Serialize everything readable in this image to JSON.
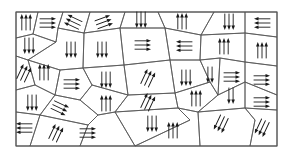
{
  "figure": {
    "width": 291,
    "height": 161,
    "frame": {
      "x": 16,
      "y": 12,
      "width": 261,
      "height": 134
    },
    "colors": {
      "border": "#555555",
      "arrow": "#1a1a1a",
      "background": "#ffffff"
    },
    "grain_boundaries": [
      [
        [
          16,
          12
        ],
        [
          38,
          12
        ],
        [
          33,
          34
        ],
        [
          16,
          38
        ]
      ],
      [
        [
          38,
          12
        ],
        [
          63,
          12
        ],
        [
          58,
          28
        ],
        [
          56,
          42
        ],
        [
          33,
          34
        ]
      ],
      [
        [
          63,
          12
        ],
        [
          90,
          12
        ],
        [
          84,
          33
        ],
        [
          58,
          28
        ]
      ],
      [
        [
          90,
          12
        ],
        [
          125,
          12
        ],
        [
          120,
          28
        ],
        [
          84,
          33
        ]
      ],
      [
        [
          125,
          12
        ],
        [
          158,
          12
        ],
        [
          165,
          28
        ],
        [
          120,
          28
        ]
      ],
      [
        [
          158,
          12
        ],
        [
          214,
          12
        ],
        [
          201,
          35
        ],
        [
          165,
          28
        ]
      ],
      [
        [
          214,
          12
        ],
        [
          245,
          12
        ],
        [
          245,
          33
        ],
        [
          201,
          35
        ]
      ],
      [
        [
          245,
          12
        ],
        [
          277,
          12
        ],
        [
          277,
          37
        ],
        [
          245,
          33
        ]
      ],
      [
        [
          16,
          38
        ],
        [
          33,
          34
        ],
        [
          56,
          42
        ],
        [
          28,
          60
        ],
        [
          16,
          56
        ]
      ],
      [
        [
          16,
          56
        ],
        [
          28,
          60
        ],
        [
          35,
          85
        ],
        [
          16,
          90
        ]
      ],
      [
        [
          56,
          42
        ],
        [
          58,
          28
        ],
        [
          84,
          33
        ],
        [
          83,
          68
        ],
        [
          60,
          70
        ],
        [
          28,
          60
        ]
      ],
      [
        [
          84,
          33
        ],
        [
          120,
          28
        ],
        [
          124,
          65
        ],
        [
          83,
          68
        ]
      ],
      [
        [
          120,
          28
        ],
        [
          165,
          28
        ],
        [
          170,
          60
        ],
        [
          124,
          65
        ]
      ],
      [
        [
          165,
          28
        ],
        [
          201,
          35
        ],
        [
          200,
          60
        ],
        [
          170,
          60
        ]
      ],
      [
        [
          201,
          35
        ],
        [
          245,
          33
        ],
        [
          245,
          62
        ],
        [
          220,
          58
        ],
        [
          200,
          60
        ]
      ],
      [
        [
          245,
          33
        ],
        [
          277,
          37
        ],
        [
          277,
          66
        ],
        [
          245,
          62
        ]
      ],
      [
        [
          28,
          60
        ],
        [
          60,
          70
        ],
        [
          55,
          95
        ],
        [
          35,
          85
        ]
      ],
      [
        [
          60,
          70
        ],
        [
          83,
          68
        ],
        [
          92,
          85
        ],
        [
          80,
          100
        ],
        [
          55,
          95
        ]
      ],
      [
        [
          83,
          68
        ],
        [
          124,
          65
        ],
        [
          128,
          95
        ],
        [
          92,
          85
        ]
      ],
      [
        [
          124,
          65
        ],
        [
          170,
          60
        ],
        [
          175,
          93
        ],
        [
          128,
          95
        ]
      ],
      [
        [
          170,
          60
        ],
        [
          200,
          60
        ],
        [
          210,
          82
        ],
        [
          175,
          93
        ]
      ],
      [
        [
          200,
          60
        ],
        [
          220,
          58
        ],
        [
          218,
          95
        ],
        [
          210,
          82
        ]
      ],
      [
        [
          220,
          58
        ],
        [
          245,
          62
        ],
        [
          245,
          82
        ],
        [
          218,
          95
        ]
      ],
      [
        [
          245,
          62
        ],
        [
          277,
          66
        ],
        [
          277,
          95
        ],
        [
          245,
          82
        ]
      ],
      [
        [
          16,
          90
        ],
        [
          35,
          85
        ],
        [
          55,
          95
        ],
        [
          40,
          115
        ],
        [
          16,
          112
        ]
      ],
      [
        [
          55,
          95
        ],
        [
          80,
          100
        ],
        [
          98,
          115
        ],
        [
          88,
          125
        ],
        [
          40,
          115
        ]
      ],
      [
        [
          80,
          100
        ],
        [
          92,
          85
        ],
        [
          128,
          95
        ],
        [
          115,
          112
        ],
        [
          98,
          115
        ]
      ],
      [
        [
          128,
          95
        ],
        [
          175,
          93
        ],
        [
          178,
          108
        ],
        [
          115,
          112
        ]
      ],
      [
        [
          175,
          93
        ],
        [
          210,
          82
        ],
        [
          218,
          95
        ],
        [
          198,
          112
        ],
        [
          178,
          108
        ]
      ],
      [
        [
          218,
          95
        ],
        [
          245,
          82
        ],
        [
          245,
          108
        ],
        [
          198,
          112
        ]
      ],
      [
        [
          245,
          82
        ],
        [
          277,
          95
        ],
        [
          277,
          110
        ],
        [
          245,
          108
        ]
      ],
      [
        [
          16,
          112
        ],
        [
          40,
          115
        ],
        [
          30,
          146
        ],
        [
          16,
          146
        ]
      ],
      [
        [
          40,
          115
        ],
        [
          88,
          125
        ],
        [
          80,
          146
        ],
        [
          30,
          146
        ]
      ],
      [
        [
          88,
          125
        ],
        [
          98,
          115
        ],
        [
          115,
          112
        ],
        [
          135,
          146
        ],
        [
          80,
          146
        ]
      ],
      [
        [
          115,
          112
        ],
        [
          178,
          108
        ],
        [
          190,
          120
        ],
        [
          135,
          146
        ]
      ],
      [
        [
          178,
          108
        ],
        [
          198,
          112
        ],
        [
          200,
          146
        ],
        [
          135,
          146
        ],
        [
          190,
          120
        ]
      ],
      [
        [
          198,
          112
        ],
        [
          245,
          108
        ],
        [
          255,
          120
        ],
        [
          250,
          146
        ],
        [
          200,
          146
        ]
      ],
      [
        [
          245,
          108
        ],
        [
          277,
          110
        ],
        [
          277,
          146
        ],
        [
          250,
          146
        ],
        [
          255,
          120
        ]
      ]
    ],
    "domains": [
      {
        "cx": 26,
        "cy": 22,
        "dir": "up",
        "count": 3
      },
      {
        "cx": 48,
        "cy": 23,
        "dir": "right",
        "count": 3
      },
      {
        "cx": 73,
        "cy": 22,
        "dir": "up-left",
        "count": 3
      },
      {
        "cx": 104,
        "cy": 22,
        "dir": "right-up",
        "count": 3
      },
      {
        "cx": 141,
        "cy": 20,
        "dir": "down",
        "count": 3
      },
      {
        "cx": 182,
        "cy": 21,
        "dir": "up",
        "count": 3
      },
      {
        "cx": 229,
        "cy": 22,
        "dir": "down",
        "count": 3
      },
      {
        "cx": 262,
        "cy": 23,
        "dir": "left",
        "count": 3
      },
      {
        "cx": 29,
        "cy": 46,
        "dir": "down",
        "count": 3
      },
      {
        "cx": 24,
        "cy": 73,
        "dir": "up-right",
        "count": 3
      },
      {
        "cx": 71,
        "cy": 50,
        "dir": "down",
        "count": 3
      },
      {
        "cx": 102,
        "cy": 50,
        "dir": "down",
        "count": 3
      },
      {
        "cx": 143,
        "cy": 45,
        "dir": "right",
        "count": 3
      },
      {
        "cx": 184,
        "cy": 46,
        "dir": "left",
        "count": 3
      },
      {
        "cx": 224,
        "cy": 46,
        "dir": "up",
        "count": 3
      },
      {
        "cx": 262,
        "cy": 50,
        "dir": "up",
        "count": 3
      },
      {
        "cx": 44,
        "cy": 72,
        "dir": "up",
        "count": 3
      },
      {
        "cx": 72,
        "cy": 84,
        "dir": "right",
        "count": 3
      },
      {
        "cx": 106,
        "cy": 80,
        "dir": "down",
        "count": 3
      },
      {
        "cx": 148,
        "cy": 78,
        "dir": "up-right",
        "count": 3
      },
      {
        "cx": 186,
        "cy": 78,
        "dir": "down",
        "count": 3
      },
      {
        "cx": 210,
        "cy": 75,
        "dir": "down",
        "count": 2
      },
      {
        "cx": 232,
        "cy": 77,
        "dir": "right",
        "count": 3
      },
      {
        "cx": 262,
        "cy": 80,
        "dir": "right",
        "count": 3
      },
      {
        "cx": 32,
        "cy": 103,
        "dir": "down",
        "count": 3
      },
      {
        "cx": 60,
        "cy": 108,
        "dir": "right-down",
        "count": 3
      },
      {
        "cx": 106,
        "cy": 103,
        "dir": "up",
        "count": 3
      },
      {
        "cx": 148,
        "cy": 102,
        "dir": "up-right",
        "count": 3
      },
      {
        "cx": 196,
        "cy": 98,
        "dir": "up",
        "count": 3
      },
      {
        "cx": 231,
        "cy": 96,
        "dir": "down",
        "count": 2
      },
      {
        "cx": 262,
        "cy": 102,
        "dir": "right",
        "count": 3
      },
      {
        "cx": 24,
        "cy": 128,
        "dir": "left",
        "count": 3
      },
      {
        "cx": 56,
        "cy": 133,
        "dir": "up-right",
        "count": 3
      },
      {
        "cx": 88,
        "cy": 133,
        "dir": "right",
        "count": 3
      },
      {
        "cx": 152,
        "cy": 124,
        "dir": "down",
        "count": 3
      },
      {
        "cx": 173,
        "cy": 130,
        "dir": "up",
        "count": 3
      },
      {
        "cx": 221,
        "cy": 124,
        "dir": "down-left",
        "count": 3
      },
      {
        "cx": 262,
        "cy": 128,
        "dir": "down-left",
        "count": 3
      }
    ]
  }
}
